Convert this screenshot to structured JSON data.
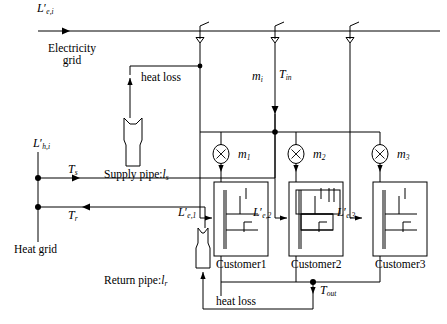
{
  "figure": {
    "type": "diagram"
  },
  "labels": {
    "electricity_supply": "L",
    "electricity_supply_sub": "e,i",
    "electricity_grid_line1": "Electricity",
    "electricity_grid_line2": "grid",
    "heat_supply": "L",
    "heat_supply_sub": "h,i",
    "heat_grid": "Heat grid",
    "heat_loss_top": "heat loss",
    "heat_loss_bottom": "heat loss",
    "supply_pipe": "Supply pipe:",
    "supply_pipe_sym": "l",
    "supply_pipe_sub": "s",
    "return_pipe": "Return pipe:",
    "return_pipe_sym": "l",
    "return_pipe_sub": "r",
    "temp_supply": "T",
    "temp_supply_sub": "s",
    "temp_return": "T",
    "temp_return_sub": "r",
    "temp_in": "T",
    "temp_in_sub": "in",
    "temp_out": "T",
    "temp_out_sub": "out",
    "mass_flow_total": "m",
    "mass_flow_total_sub": "i"
  },
  "customers": [
    {
      "name": "Customer1",
      "mass_flow": "m",
      "mass_flow_sub": "1",
      "elec_load": "L",
      "elec_load_sub": "e,1"
    },
    {
      "name": "Customer2",
      "mass_flow": "m",
      "mass_flow_sub": "2",
      "elec_load": "L",
      "elec_load_sub": "e,2"
    },
    {
      "name": "Customer3",
      "mass_flow": "m",
      "mass_flow_sub": "3",
      "elec_load": "L",
      "elec_load_sub": "e,3"
    }
  ],
  "icons": {
    "pump": "pump-circle-x-icon",
    "transformer": "transformer-tap-icon",
    "heat_exchanger": "heat-exchanger-icon",
    "junction": "junction-dot-icon",
    "arrow": "flow-arrow-icon"
  },
  "colors": {
    "line": "#000000",
    "background": "#ffffff",
    "text": "#000000"
  }
}
